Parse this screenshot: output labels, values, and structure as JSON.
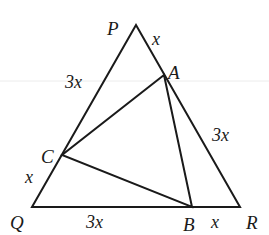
{
  "diagram": {
    "title": "",
    "type": "geometry",
    "colors": {
      "stroke": "#1a1a1a",
      "background": "#ffffff",
      "scanline": "#e8e8e8"
    },
    "points": {
      "P": {
        "x": 136,
        "y": 25
      },
      "Q": {
        "x": 32,
        "y": 207
      },
      "R": {
        "x": 240,
        "y": 207
      },
      "A": {
        "x": 164,
        "y": 75
      },
      "B": {
        "x": 192,
        "y": 207
      },
      "C": {
        "x": 62,
        "y": 155
      }
    },
    "vertex_labels": {
      "P": "P",
      "Q": "Q",
      "R": "R",
      "A": "A",
      "B": "B",
      "C": "C"
    },
    "segment_labels": {
      "PA": "x",
      "AR": "3x",
      "PC": "3x",
      "CQ": "x",
      "QB": "3x",
      "BR": "x"
    },
    "triangles": [
      {
        "name": "PQR",
        "vertices": [
          "P",
          "Q",
          "R"
        ]
      },
      {
        "name": "ABC",
        "vertices": [
          "A",
          "B",
          "C"
        ]
      }
    ]
  }
}
